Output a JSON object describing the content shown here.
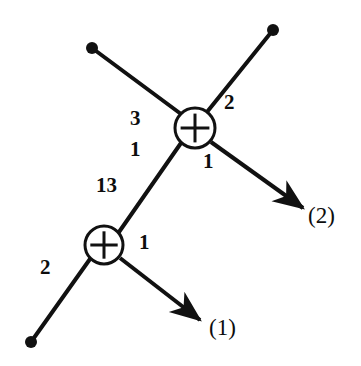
{
  "figure": {
    "background_color": "#ffffff",
    "stroke_color": "#111111",
    "width": 361,
    "height": 366
  },
  "nodes": [
    {
      "id": "adder-top",
      "symbol": "+",
      "cx": 195,
      "cy": 128,
      "r": 20
    },
    {
      "id": "adder-bottom",
      "symbol": "+",
      "cx": 104,
      "cy": 245,
      "r": 19
    }
  ],
  "terminals": [
    {
      "id": "terminal-top-left",
      "cx": 92,
      "cy": 48,
      "r": 6
    },
    {
      "id": "terminal-top-right",
      "cx": 273,
      "cy": 30,
      "r": 6
    },
    {
      "id": "terminal-bottom-left",
      "cx": 31,
      "cy": 342,
      "r": 6
    }
  ],
  "edges": [
    {
      "id": "edge-topleft-to-adder-top",
      "x1": 92,
      "y1": 48,
      "x2": 181,
      "y2": 114
    },
    {
      "id": "edge-topright-to-adder-top",
      "x1": 273,
      "y1": 30,
      "x2": 207,
      "y2": 112
    },
    {
      "id": "edge-adder-top-to-adder-bottom",
      "x1": 181,
      "y1": 143,
      "x2": 119,
      "y2": 232
    },
    {
      "id": "edge-bottomleft-to-adder-bottom",
      "x1": 31,
      "y1": 342,
      "x2": 90,
      "y2": 259
    }
  ],
  "arrows": [
    {
      "id": "arrow-output-2",
      "x1": 211,
      "y1": 142,
      "x2": 303,
      "y2": 208
    },
    {
      "id": "arrow-output-1",
      "x1": 120,
      "y1": 258,
      "x2": 200,
      "y2": 320
    }
  ],
  "edge_labels": [
    {
      "id": "label-3",
      "text": "3",
      "x": 130,
      "y": 108
    },
    {
      "id": "label-1-upper",
      "text": "1",
      "x": 130,
      "y": 139
    },
    {
      "id": "label-2-upper-right",
      "text": "2",
      "x": 224,
      "y": 92
    },
    {
      "id": "label-1-below-top-adder",
      "text": "1",
      "x": 203,
      "y": 151
    },
    {
      "id": "label-13",
      "text": "13",
      "x": 96,
      "y": 175
    },
    {
      "id": "label-1-right-bottom-adder",
      "text": "1",
      "x": 139,
      "y": 232
    },
    {
      "id": "label-2-lower-left",
      "text": "2",
      "x": 40,
      "y": 257
    }
  ],
  "port_labels": [
    {
      "id": "port-label-2",
      "text": "(2)",
      "x": 308,
      "y": 204
    },
    {
      "id": "port-label-1",
      "text": "(1)",
      "x": 209,
      "y": 316
    }
  ]
}
